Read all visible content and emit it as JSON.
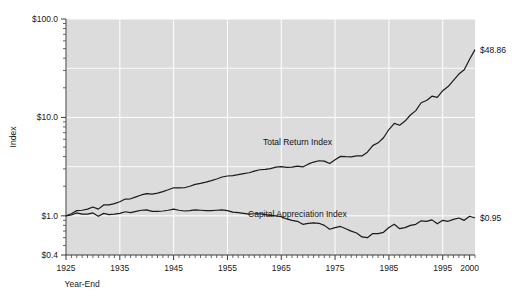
{
  "chart_data": {
    "type": "line",
    "title": "",
    "xlabel": "Year-End",
    "ylabel": "Index",
    "yscale": "log",
    "ylim": [
      0.4,
      100.0
    ],
    "xlim": [
      1925,
      2001
    ],
    "grid": true,
    "legend_position": "inline-annotation",
    "y_tick_labels": [
      "$100.0",
      "$10.0",
      "$1.0",
      "$0.4"
    ],
    "y_tick_values": [
      100.0,
      10.0,
      1.0,
      0.4
    ],
    "x_tick_labels": [
      "1925",
      "1935",
      "1945",
      "1955",
      "1965",
      "1975",
      "1985",
      "1995",
      "2000"
    ],
    "x_tick_values": [
      1925,
      1935,
      1945,
      1955,
      1965,
      1975,
      1985,
      1995,
      2000
    ],
    "annotations": [
      {
        "text": "Total Return Index",
        "x": 1968,
        "y": 5.6
      },
      {
        "text": "Capital Appreciation Index",
        "x": 1968,
        "y": 1.05
      },
      {
        "text": "$48.86",
        "x": 2001,
        "y": 48.86
      },
      {
        "text": "$0.95",
        "x": 2001,
        "y": 0.95
      }
    ],
    "series": [
      {
        "name": "Total Return Index",
        "end_label": "$48.86",
        "end_value": 48.86,
        "color": "#1a1a1a",
        "x": [
          1925,
          1926,
          1927,
          1928,
          1929,
          1930,
          1931,
          1932,
          1933,
          1934,
          1935,
          1936,
          1937,
          1938,
          1939,
          1940,
          1941,
          1942,
          1943,
          1944,
          1945,
          1946,
          1947,
          1948,
          1949,
          1950,
          1951,
          1952,
          1953,
          1954,
          1955,
          1956,
          1957,
          1958,
          1959,
          1960,
          1961,
          1962,
          1963,
          1964,
          1965,
          1966,
          1967,
          1968,
          1969,
          1970,
          1971,
          1972,
          1973,
          1974,
          1975,
          1976,
          1977,
          1978,
          1979,
          1980,
          1981,
          1982,
          1983,
          1984,
          1985,
          1986,
          1987,
          1988,
          1989,
          1990,
          1991,
          1992,
          1993,
          1994,
          1995,
          1996,
          1997,
          1998,
          1999,
          2000,
          2001
        ],
        "values": [
          1.0,
          1.05,
          1.13,
          1.14,
          1.17,
          1.23,
          1.17,
          1.29,
          1.29,
          1.33,
          1.39,
          1.48,
          1.49,
          1.56,
          1.63,
          1.68,
          1.66,
          1.7,
          1.76,
          1.84,
          1.93,
          1.92,
          1.93,
          2.0,
          2.09,
          2.14,
          2.2,
          2.28,
          2.37,
          2.48,
          2.54,
          2.56,
          2.62,
          2.69,
          2.74,
          2.85,
          2.94,
          2.96,
          3.02,
          3.12,
          3.16,
          3.11,
          3.12,
          3.2,
          3.14,
          3.35,
          3.52,
          3.63,
          3.6,
          3.4,
          3.72,
          4.02,
          3.99,
          3.98,
          4.07,
          4.06,
          4.43,
          5.17,
          5.52,
          6.22,
          7.53,
          8.7,
          8.33,
          9.19,
          10.58,
          11.73,
          14.1,
          14.86,
          16.43,
          16.0,
          18.7,
          20.6,
          23.8,
          27.6,
          30.5,
          39.0,
          48.86
        ],
        "description": "Long-term government bond total return index, 1925=1.00, rising to 48.86"
      },
      {
        "name": "Capital Appreciation Index",
        "end_label": "$0.95",
        "end_value": 0.95,
        "color": "#1a1a1a",
        "x": [
          1925,
          1926,
          1927,
          1928,
          1929,
          1930,
          1931,
          1932,
          1933,
          1934,
          1935,
          1936,
          1937,
          1938,
          1939,
          1940,
          1941,
          1942,
          1943,
          1944,
          1945,
          1946,
          1947,
          1948,
          1949,
          1950,
          1951,
          1952,
          1953,
          1954,
          1955,
          1956,
          1957,
          1958,
          1959,
          1960,
          1961,
          1962,
          1963,
          1964,
          1965,
          1966,
          1967,
          1968,
          1969,
          1970,
          1971,
          1972,
          1973,
          1974,
          1975,
          1976,
          1977,
          1978,
          1979,
          1980,
          1981,
          1982,
          1983,
          1984,
          1985,
          1986,
          1987,
          1988,
          1989,
          1990,
          1991,
          1992,
          1993,
          1994,
          1995,
          1996,
          1997,
          1998,
          1999,
          2000,
          2001
        ],
        "values": [
          1.0,
          1.02,
          1.07,
          1.04,
          1.04,
          1.07,
          0.99,
          1.06,
          1.03,
          1.04,
          1.06,
          1.1,
          1.08,
          1.11,
          1.14,
          1.15,
          1.11,
          1.11,
          1.12,
          1.14,
          1.17,
          1.14,
          1.12,
          1.13,
          1.15,
          1.14,
          1.13,
          1.13,
          1.14,
          1.15,
          1.13,
          1.09,
          1.08,
          1.06,
          1.04,
          1.05,
          1.05,
          1.03,
          1.01,
          1.0,
          0.98,
          0.93,
          0.9,
          0.88,
          0.82,
          0.84,
          0.85,
          0.84,
          0.8,
          0.73,
          0.76,
          0.78,
          0.74,
          0.7,
          0.67,
          0.61,
          0.6,
          0.66,
          0.66,
          0.68,
          0.76,
          0.82,
          0.74,
          0.76,
          0.8,
          0.82,
          0.89,
          0.88,
          0.91,
          0.83,
          0.9,
          0.88,
          0.92,
          0.95,
          0.9,
          0.99,
          0.95
        ],
        "description": "Long-term government bond capital appreciation index, 1925=1.00, ending at 0.95"
      }
    ]
  },
  "colors": {
    "plot_background": "#dcdcdc",
    "gridline": "#ffffff",
    "line": "#1a1a1a",
    "text": "#1a1a1a",
    "page_background": "#ffffff"
  }
}
